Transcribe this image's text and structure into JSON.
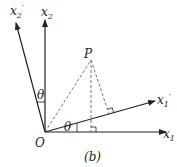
{
  "diagram": {
    "panel_label": "(b)",
    "origin_label": "O",
    "point_label": "P",
    "angle_label": "θ",
    "axes": [
      {
        "id": "x1",
        "base": "x",
        "sub": "1",
        "prime": ""
      },
      {
        "id": "x2",
        "base": "x",
        "sub": "2",
        "prime": ""
      },
      {
        "id": "x1p",
        "base": "x",
        "sub": "1",
        "prime": "′"
      },
      {
        "id": "x2p",
        "base": "x",
        "sub": "2",
        "prime": "′"
      }
    ],
    "colors": {
      "line": "#222222",
      "dashed": "#555555"
    }
  }
}
